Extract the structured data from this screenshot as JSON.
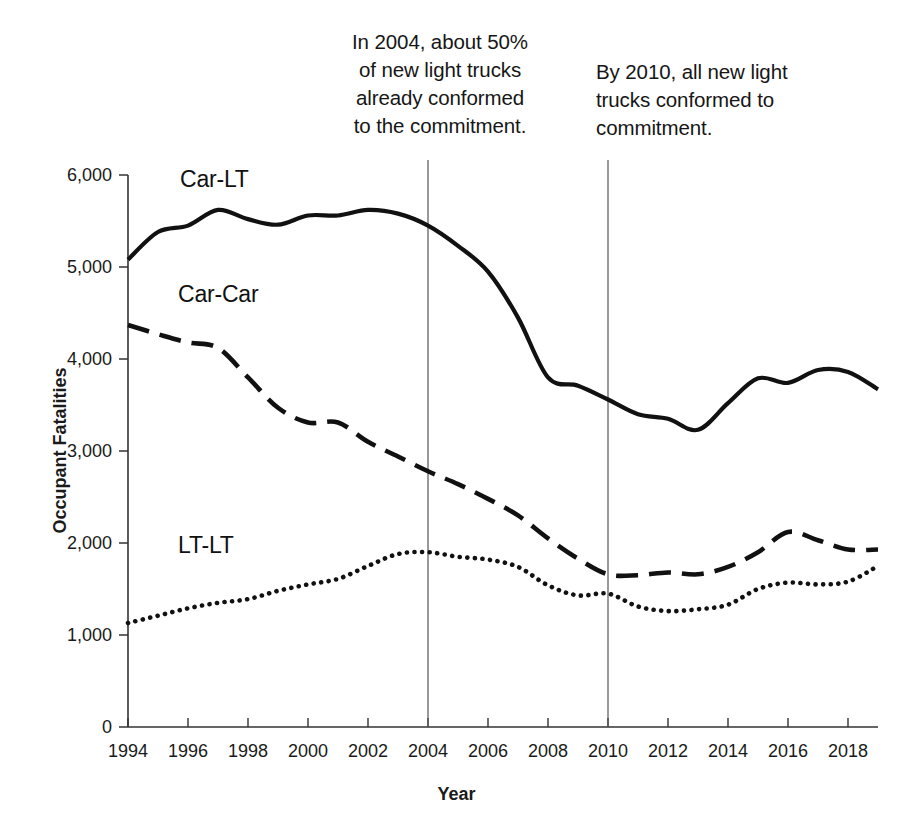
{
  "chart_data": {
    "type": "line",
    "title": "",
    "xlabel": "Year",
    "ylabel": "Occupant Fatalities",
    "xlim": [
      1994,
      2019
    ],
    "ylim": [
      0,
      6000
    ],
    "grid": false,
    "legend_position": "inline-labels",
    "x": [
      1994,
      1995,
      1996,
      1997,
      1998,
      1999,
      2000,
      2001,
      2002,
      2003,
      2004,
      2005,
      2006,
      2007,
      2008,
      2009,
      2010,
      2011,
      2012,
      2013,
      2014,
      2015,
      2016,
      2017,
      2018,
      2019
    ],
    "xticks": [
      "1994",
      "1996",
      "1998",
      "2000",
      "2002",
      "2004",
      "2006",
      "2008",
      "2010",
      "2012",
      "2014",
      "2016",
      "2018"
    ],
    "yticks": [
      "0",
      "1,000",
      "2,000",
      "3,000",
      "4,000",
      "5,000",
      "6,000"
    ],
    "series": [
      {
        "name": "Car-LT",
        "style": "solid",
        "values": [
          5080,
          5380,
          5450,
          5620,
          5520,
          5460,
          5560,
          5560,
          5620,
          5580,
          5450,
          5230,
          4950,
          4450,
          3800,
          3710,
          3560,
          3400,
          3350,
          3230,
          3520,
          3790,
          3740,
          3880,
          3860,
          3670
        ]
      },
      {
        "name": "Car-Car",
        "style": "dashed",
        "values": [
          4370,
          4270,
          4180,
          4120,
          3800,
          3470,
          3310,
          3310,
          3100,
          2940,
          2780,
          2640,
          2480,
          2300,
          2050,
          1830,
          1660,
          1650,
          1680,
          1660,
          1740,
          1900,
          2120,
          2030,
          1930,
          1930
        ]
      },
      {
        "name": "LT-LT",
        "style": "dotted",
        "values": [
          1130,
          1210,
          1290,
          1350,
          1390,
          1480,
          1550,
          1610,
          1750,
          1880,
          1900,
          1850,
          1820,
          1740,
          1540,
          1430,
          1450,
          1310,
          1260,
          1280,
          1330,
          1500,
          1570,
          1550,
          1580,
          1750
        ]
      }
    ],
    "annotations": [
      {
        "id": "annotation-2004",
        "text": "In 2004, about 50%\nof new light trucks\nalready conformed\nto the commitment.",
        "marker_year": 2004,
        "marker_type": "vertical-line"
      },
      {
        "id": "annotation-2010",
        "text": "By 2010, all new light\ntrucks conformed to\ncommitment.",
        "marker_year": 2010,
        "marker_type": "vertical-line"
      }
    ],
    "colors": {
      "line": "#111111",
      "axis": "#333333",
      "marker_line": "#555555",
      "background": "#ffffff"
    }
  }
}
